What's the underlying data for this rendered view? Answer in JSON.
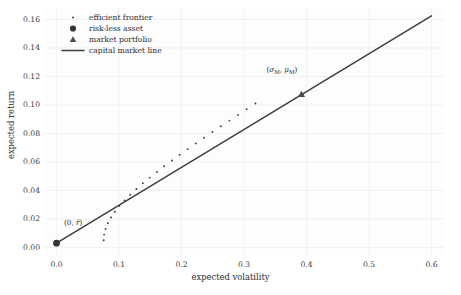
{
  "chart_data": {
    "type": "line",
    "title": "",
    "xlabel": "expected volatility",
    "ylabel": "expected return",
    "xlim": [
      -0.02,
      0.62
    ],
    "ylim": [
      -0.006,
      0.168
    ],
    "xticks": [
      "0.0",
      "0.1",
      "0.2",
      "0.3",
      "0.4",
      "0.5",
      "0.6"
    ],
    "xtick_values": [
      0.0,
      0.1,
      0.2,
      0.3,
      0.4,
      0.5,
      0.6
    ],
    "yticks": [
      "0.00",
      "0.02",
      "0.04",
      "0.06",
      "0.08",
      "0.10",
      "0.12",
      "0.14",
      "0.16"
    ],
    "ytick_values": [
      0.0,
      0.02,
      0.04,
      0.06,
      0.08,
      0.1,
      0.12,
      0.14,
      0.16
    ],
    "grid": true,
    "legend_position": "upper left",
    "series": [
      {
        "name": "efficient frontier",
        "type": "scatter",
        "marker": "dot",
        "color": "#3d3d3d",
        "x": [
          0.0755,
          0.0762,
          0.0785,
          0.0822,
          0.0872,
          0.0935,
          0.1008,
          0.109,
          0.118,
          0.1278,
          0.1382,
          0.1492,
          0.1606,
          0.1724,
          0.1846,
          0.197,
          0.2098,
          0.2228,
          0.236,
          0.2494,
          0.263,
          0.2766,
          0.2904,
          0.3043,
          0.3183
        ],
        "y": [
          0.005,
          0.009,
          0.013,
          0.017,
          0.021,
          0.025,
          0.029,
          0.033,
          0.037,
          0.041,
          0.045,
          0.049,
          0.053,
          0.057,
          0.061,
          0.065,
          0.069,
          0.073,
          0.077,
          0.081,
          0.085,
          0.089,
          0.093,
          0.097,
          0.101
        ]
      },
      {
        "name": "capital market line",
        "type": "line",
        "color": "#3d3d3d",
        "x": [
          0.0,
          0.6
        ],
        "y": [
          0.003,
          0.1625
        ],
        "slope": 0.2658,
        "intercept": 0.003
      },
      {
        "name": "risk-less asset",
        "type": "scatter",
        "marker": "circle",
        "color": "#353535",
        "x": [
          0.0
        ],
        "y": [
          0.003
        ]
      },
      {
        "name": "market portfolio",
        "type": "scatter",
        "marker": "triangle",
        "color": "#4a4a4a",
        "x": [
          0.392
        ],
        "y": [
          0.1075
        ]
      }
    ],
    "annotations": [
      {
        "id": "risk-free-point-label",
        "text": "(0, r̄)",
        "parts": {
          "open": "(0, ",
          "sym": "r̄",
          "close": ")"
        },
        "x": 0.012,
        "y": 0.0165
      },
      {
        "id": "market-portfolio-label",
        "text": "(σM, μM)",
        "parts": {
          "open": "(",
          "sym1": "σ",
          "sub1": "M",
          "mid": ", ",
          "sym2": "μ",
          "sub2": "M",
          "close": ")"
        },
        "x": 0.336,
        "y": 0.1235
      }
    ]
  },
  "legend": {
    "items": [
      {
        "label": "efficient frontier",
        "marker": "dot-marker"
      },
      {
        "label": "risk-less asset",
        "marker": "circle-marker"
      },
      {
        "label": "market portfolio",
        "marker": "triangle-marker"
      },
      {
        "label": "capital market line",
        "marker": "line-marker"
      }
    ]
  },
  "colors": {
    "ink": "#3d3d3d",
    "text": "#2b2b2b",
    "tick": "#3b3b3b",
    "grid": "#ececec",
    "background": "#fdfdfd"
  }
}
